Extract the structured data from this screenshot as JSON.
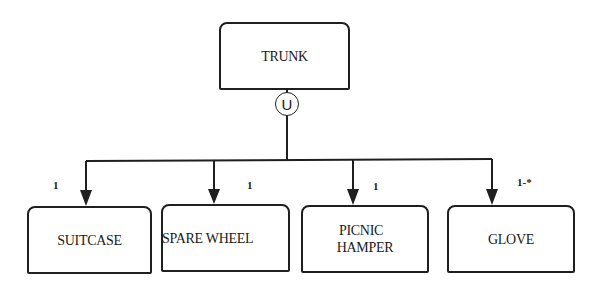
{
  "diagram": {
    "type": "composition-hierarchy",
    "parent": {
      "label": "TRUNK"
    },
    "connector": {
      "symbol": "U"
    },
    "children": [
      {
        "label": "SUITCASE",
        "multiplicity": "1"
      },
      {
        "label": "SPARE WHEEL",
        "multiplicity": "1"
      },
      {
        "label": "PICNIC HAMPER",
        "label_lines": [
          "PICNIC",
          "HAMPER"
        ],
        "multiplicity": "1"
      },
      {
        "label": "GLOVE",
        "multiplicity": "1-*"
      }
    ]
  }
}
